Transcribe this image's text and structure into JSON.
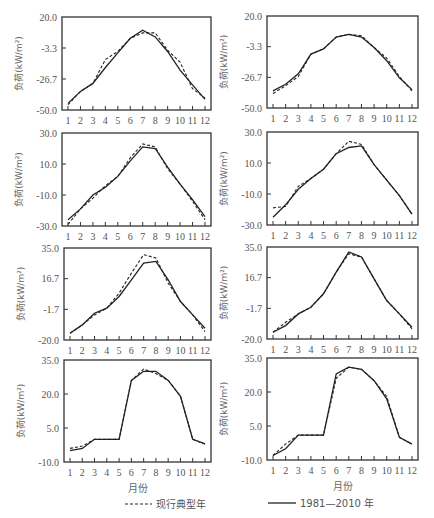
{
  "chart_data": [
    {
      "type": "line",
      "panel": "row1-left",
      "x": [
        1,
        2,
        3,
        4,
        5,
        6,
        7,
        8,
        9,
        10,
        11,
        12
      ],
      "xlabel": "",
      "ylabel": "负荷(kW/m²)",
      "yticks": [
        "20.0",
        "-3.3",
        "-26.7",
        "-50.0"
      ],
      "ylim": [
        -50.0,
        20.0
      ],
      "series": [
        {
          "name": "1981—2010 年",
          "style": "solid",
          "values": [
            -45,
            -36,
            -30,
            -18,
            -7,
            4,
            10,
            5,
            -6,
            -20,
            -31,
            -42
          ]
        },
        {
          "name": "现行典型年",
          "style": "dashed",
          "values": [
            -46,
            -36,
            -30,
            -12,
            -6,
            4,
            8,
            8,
            -5,
            -14,
            -34,
            -41
          ]
        }
      ]
    },
    {
      "type": "line",
      "panel": "row1-right",
      "x": [
        1,
        2,
        3,
        4,
        5,
        6,
        7,
        8,
        9,
        10,
        11,
        12
      ],
      "xlabel": "",
      "ylabel": "负荷(kW/m²)",
      "yticks": [
        "20.0",
        "-3.3",
        "-26.7",
        "-50.0"
      ],
      "ylim": [
        -50.0,
        20.0
      ],
      "series": [
        {
          "name": "1981—2010 年",
          "style": "solid",
          "values": [
            -37,
            -32,
            -24,
            -9,
            -5,
            4,
            6,
            4,
            -4,
            -14,
            -27,
            -36
          ]
        },
        {
          "name": "现行典型年",
          "style": "dashed",
          "values": [
            -39,
            -33,
            -26,
            -9,
            -5,
            4,
            6,
            5,
            -4,
            -12,
            -26,
            -37
          ]
        }
      ]
    },
    {
      "type": "line",
      "panel": "row2-left",
      "x": [
        1,
        2,
        3,
        4,
        5,
        6,
        7,
        8,
        9,
        10,
        11,
        12
      ],
      "xlabel": "",
      "ylabel": "负荷(kW/m²)",
      "yticks": [
        "30.0",
        "10.0",
        "-10.0",
        "-30.0"
      ],
      "ylim": [
        -30.0,
        30.0
      ],
      "series": [
        {
          "name": "1981—2010 年",
          "style": "solid",
          "values": [
            -26,
            -19,
            -10,
            -5,
            2,
            12,
            21,
            20,
            8,
            -3,
            -13,
            -24
          ]
        },
        {
          "name": "现行典型年",
          "style": "dashed",
          "values": [
            -29,
            -19,
            -12,
            -4,
            2,
            14,
            23,
            21,
            7,
            -3,
            -14,
            -26
          ]
        }
      ]
    },
    {
      "type": "line",
      "panel": "row2-right",
      "x": [
        1,
        2,
        3,
        4,
        5,
        6,
        7,
        8,
        9,
        10,
        11,
        12
      ],
      "xlabel": "",
      "ylabel": "负荷(kW/m²)",
      "yticks": [
        "30.0",
        "10.0",
        "-10.0",
        "-30.0"
      ],
      "ylim": [
        -30.0,
        30.0
      ],
      "series": [
        {
          "name": "1981—2010 年",
          "style": "solid",
          "values": [
            -25,
            -17,
            -7,
            0,
            6,
            16,
            20,
            21,
            9,
            -1,
            -11,
            -23
          ]
        },
        {
          "name": "现行典型年",
          "style": "dashed",
          "values": [
            -19,
            -18,
            -5,
            0,
            6,
            16,
            24,
            22,
            9,
            -1,
            -11,
            -23
          ]
        }
      ]
    },
    {
      "type": "line",
      "panel": "row3-left",
      "x": [
        1,
        2,
        3,
        4,
        5,
        6,
        7,
        8,
        9,
        10,
        11,
        12
      ],
      "xlabel": "",
      "ylabel": "负荷(kW/m²)",
      "yticks": [
        "35.0",
        "16.7",
        "-1.7",
        "-20.0"
      ],
      "ylim": [
        -20.0,
        35.0
      ],
      "series": [
        {
          "name": "1981—2010 年",
          "style": "solid",
          "values": [
            -16,
            -11,
            -4,
            -1,
            6,
            16,
            26,
            27,
            16,
            3,
            -5,
            -13
          ]
        },
        {
          "name": "现行典型年",
          "style": "dashed",
          "values": [
            -16,
            -11,
            -5,
            -1,
            8,
            20,
            31,
            29,
            14,
            3,
            -5,
            -15
          ]
        }
      ]
    },
    {
      "type": "line",
      "panel": "row3-right",
      "x": [
        1,
        2,
        3,
        4,
        5,
        6,
        7,
        8,
        9,
        10,
        11,
        12
      ],
      "xlabel": "",
      "ylabel": "负荷(kW/m²)",
      "yticks": [
        "35.0",
        "16.7",
        "-1.7",
        "-20.0"
      ],
      "ylim": [
        -20.0,
        35.0
      ],
      "series": [
        {
          "name": "1981—2010 年",
          "style": "solid",
          "values": [
            -16,
            -12,
            -5,
            -1,
            7,
            20,
            32,
            29,
            16,
            3,
            -5,
            -13
          ]
        },
        {
          "name": "现行典型年",
          "style": "dashed",
          "values": [
            -16,
            -10,
            -5,
            -1,
            7,
            20,
            31,
            29,
            16,
            3,
            -5,
            -14
          ]
        }
      ]
    },
    {
      "type": "line",
      "panel": "row4-left",
      "x": [
        1,
        2,
        3,
        4,
        5,
        6,
        7,
        8,
        9,
        10,
        11,
        12
      ],
      "xlabel": "月份",
      "ylabel": "负荷(kW/m²)",
      "yticks": [
        "35.0",
        "20.0",
        "5.0",
        "-10.0"
      ],
      "ylim": [
        -10.0,
        35.0
      ],
      "series": [
        {
          "name": "1981—2010 年",
          "style": "solid",
          "values": [
            -5,
            -4,
            0,
            0,
            0,
            26,
            30,
            30,
            26,
            19,
            0,
            -2
          ]
        },
        {
          "name": "现行典型年",
          "style": "dashed",
          "values": [
            -4,
            -3,
            0,
            0,
            0,
            26,
            31,
            29,
            26,
            19,
            0,
            -2
          ]
        }
      ]
    },
    {
      "type": "line",
      "panel": "row4-right",
      "x": [
        1,
        2,
        3,
        4,
        5,
        6,
        7,
        8,
        9,
        10,
        11,
        12
      ],
      "xlabel": "月份",
      "ylabel": "负荷(kW/m²)",
      "yticks": [
        "35.0",
        "20.0",
        "5.0",
        "-10.0"
      ],
      "ylim": [
        -10.0,
        35.0
      ],
      "series": [
        {
          "name": "1981—2010 年",
          "style": "solid",
          "values": [
            -8,
            -5,
            1,
            1,
            1,
            28,
            31,
            30,
            25,
            17,
            0,
            -3
          ]
        },
        {
          "name": "现行典型年",
          "style": "dashed",
          "values": [
            -8,
            -3,
            1,
            1,
            1,
            26,
            31,
            30,
            25,
            18,
            0,
            -3
          ]
        }
      ]
    }
  ],
  "axis": {
    "y_title": "负荷(kW/m²)",
    "x_title": "月份",
    "x_ticks": [
      "1",
      "2",
      "3",
      "4",
      "5",
      "6",
      "7",
      "8",
      "9",
      "10",
      "11",
      "12"
    ]
  },
  "legend": {
    "dashed_label": "现行典型年",
    "solid_label": "1981—2010 年"
  },
  "colors": {
    "line": "#222222",
    "frame": "#333333",
    "text": "#555555"
  }
}
